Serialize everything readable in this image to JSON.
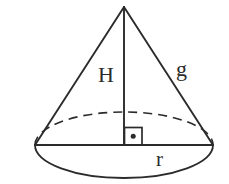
{
  "figure": {
    "type": "geometry-diagram",
    "shape": "cone",
    "background_color": "#ffffff",
    "stroke_color": "#2b2b2b",
    "labels": {
      "height": "H",
      "slant": "g",
      "radius": "r"
    },
    "markers": {
      "right_angle": "right-angle-square-with-dot"
    },
    "geometry": {
      "apex": {
        "x": 124,
        "y": 7
      },
      "base_center": {
        "x": 124,
        "y": 145
      },
      "base_left": {
        "x": 35,
        "y": 145
      },
      "base_right": {
        "x": 213,
        "y": 145
      },
      "base_ellipse_rx": 89,
      "base_ellipse_ry": 33,
      "front_arc_visible": true,
      "back_arc_dashed": true,
      "axis_line": "apex-to-base-center",
      "slant_lines": [
        "apex-to-base-left",
        "apex-to-base-right"
      ],
      "diameter_line": "base-left-to-base-right",
      "right_angle_square": {
        "x": 124,
        "y": 128,
        "size": 18
      }
    }
  }
}
